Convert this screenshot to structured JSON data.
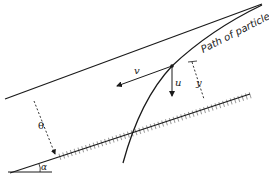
{
  "diagram": {
    "labels": {
      "path": "Path of particle",
      "v": "v",
      "u": "u",
      "y": "y",
      "theta": "θ",
      "alpha": "α"
    },
    "colors": {
      "ink": "#1a1a1a",
      "background": "#ffffff"
    }
  }
}
